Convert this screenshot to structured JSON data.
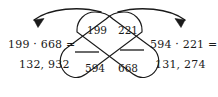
{
  "figure": {
    "stroke_color": "#1a1a1a",
    "background_color": "#ffffff",
    "text_color": "#1a1a1a"
  },
  "equations": {
    "left": {
      "expression": "199 · 668 =",
      "result": "132, 932"
    },
    "right": {
      "expression": "594 · 221 =",
      "result": "131, 274"
    }
  },
  "capsules": {
    "left_capsule": {
      "name": "capsule-nw-se",
      "top_number": "199",
      "bottom_number": "668"
    },
    "right_capsule": {
      "name": "capsule-ne-sw",
      "top_number": "221",
      "bottom_number": "594"
    }
  },
  "numbers": {
    "top_left": "199",
    "top_right": "221",
    "bottom_left": "594",
    "bottom_right": "668"
  },
  "arrows": {
    "left_arrow": {
      "name": "arrow-arc-left",
      "direction": "leftward",
      "arrowhead": "west"
    },
    "right_arrow": {
      "name": "arrow-arc-right",
      "direction": "rightward",
      "arrowhead": "east"
    }
  },
  "tick_marks": {
    "left_tick": "horizontal-strike-left-crossing",
    "right_tick": "horizontal-strike-right-crossing"
  }
}
